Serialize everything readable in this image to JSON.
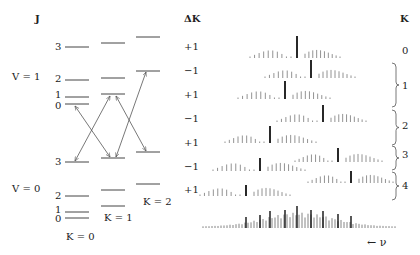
{
  "labels": {
    "j_header": "J",
    "dk_header": "ΔK",
    "k_header": "K",
    "v1": "V = 1",
    "v0": "V = 0",
    "k0": "K = 0",
    "k1": "K = 1",
    "k2": "K = 2",
    "nu_axis": "← ν"
  },
  "j_labels_upper": [
    {
      "text": "3",
      "y": 47
    },
    {
      "text": "2",
      "y": 79
    },
    {
      "text": "1",
      "y": 95
    },
    {
      "text": "0",
      "y": 106
    }
  ],
  "j_labels_lower": [
    {
      "text": "3",
      "y": 162
    },
    {
      "text": "2",
      "y": 196
    },
    {
      "text": "1",
      "y": 210
    },
    {
      "text": "0",
      "y": 219
    }
  ],
  "delta_k": [
    {
      "text": "+1",
      "y": 47
    },
    {
      "text": "−1",
      "y": 71
    },
    {
      "text": "+1",
      "y": 95
    },
    {
      "text": "−1",
      "y": 119
    },
    {
      "text": "+1",
      "y": 143
    },
    {
      "text": "−1",
      "y": 167
    },
    {
      "text": "+1",
      "y": 190
    }
  ],
  "k_values": [
    {
      "text": "0",
      "y": 51
    },
    {
      "text": "1",
      "y": 86
    },
    {
      "text": "2",
      "y": 126
    },
    {
      "text": "3",
      "y": 155
    },
    {
      "text": "4",
      "y": 186
    }
  ],
  "levels": {
    "K0": {
      "x1": 65,
      "x2": 89,
      "upper": [
        47,
        80,
        97,
        104
      ],
      "lower": [
        162,
        196,
        212,
        218
      ]
    },
    "K1": {
      "x1": 101,
      "x2": 125,
      "upper": [
        43,
        78,
        94
      ],
      "lower": [
        158,
        190,
        206
      ]
    },
    "K2": {
      "x1": 136,
      "x2": 160,
      "upper": [
        37,
        71
      ],
      "lower": [
        152,
        184
      ]
    }
  },
  "transitions": [
    {
      "from": [
        92,
        133
      ],
      "to": [
        75,
        105
      ]
    },
    {
      "from": [
        92,
        133
      ],
      "to": [
        110,
        95
      ]
    },
    {
      "from": [
        92,
        133
      ],
      "to": [
        75,
        162
      ]
    },
    {
      "from": [
        92,
        133
      ],
      "to": [
        110,
        158
      ]
    },
    {
      "from": [
        128,
        140
      ],
      "to": [
        116,
        95
      ]
    },
    {
      "from": [
        128,
        140
      ],
      "to": [
        147,
        72
      ]
    },
    {
      "from": [
        128,
        140
      ],
      "to": [
        116,
        158
      ]
    },
    {
      "from": [
        128,
        140
      ],
      "to": [
        146,
        152
      ]
    }
  ],
  "spectrum_rows": [
    {
      "k": 0,
      "dk": "+1",
      "baseline": 58,
      "center": 297,
      "q_height": 22,
      "p_start": 250,
      "r_end": 340
    },
    {
      "k": 1,
      "dk": "-1",
      "baseline": 78,
      "center": 311,
      "q_height": 18,
      "p_start": 265,
      "r_end": 355
    },
    {
      "k": 1,
      "dk": "+1",
      "baseline": 99,
      "center": 285,
      "q_height": 18,
      "p_start": 238,
      "r_end": 330
    },
    {
      "k": 2,
      "dk": "-1",
      "baseline": 122,
      "center": 323,
      "q_height": 17,
      "p_start": 277,
      "r_end": 366
    },
    {
      "k": 2,
      "dk": "+1",
      "baseline": 143,
      "center": 270,
      "q_height": 17,
      "p_start": 225,
      "r_end": 316
    },
    {
      "k": 3,
      "dk": "-1",
      "baseline": 162,
      "center": 338,
      "q_height": 14,
      "p_start": 295,
      "r_end": 382
    },
    {
      "k": 3,
      "dk": "+1",
      "baseline": 171,
      "center": 260,
      "q_height": 13,
      "p_start": 213,
      "r_end": 305
    },
    {
      "k": 4,
      "dk": "-1",
      "baseline": 183,
      "center": 351,
      "q_height": 12,
      "p_start": 308,
      "r_end": 393
    },
    {
      "k": 4,
      "dk": "+1",
      "baseline": 196,
      "center": 246,
      "q_height": 11,
      "p_start": 200,
      "r_end": 290
    }
  ],
  "braces": [
    {
      "label": "1",
      "y1": 63,
      "y2": 107
    },
    {
      "label": "2",
      "y1": 110,
      "y2": 145
    },
    {
      "label": "3",
      "y1": 146,
      "y2": 170
    },
    {
      "label": "4",
      "y1": 172,
      "y2": 200
    }
  ],
  "composite": {
    "baseline": 228,
    "x_start": 203,
    "x_end": 395
  }
}
